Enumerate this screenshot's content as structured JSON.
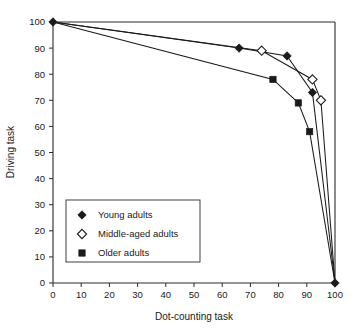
{
  "chart_data": {
    "type": "line",
    "title": "",
    "xlabel": "Dot-counting task",
    "ylabel": "Driving task",
    "xlim": [
      0,
      100
    ],
    "ylim": [
      0,
      100
    ],
    "xticks": [
      0,
      10,
      20,
      30,
      40,
      50,
      60,
      70,
      80,
      90,
      100
    ],
    "yticks": [
      0,
      10,
      20,
      30,
      40,
      50,
      60,
      70,
      80,
      90,
      100
    ],
    "grid": false,
    "legend_position": "lower-left-inside",
    "series": [
      {
        "name": "Young adults",
        "marker": "filled-diamond",
        "color": "#1a1a1a",
        "points": [
          {
            "x": 0,
            "y": 100
          },
          {
            "x": 66,
            "y": 90
          },
          {
            "x": 83,
            "y": 87
          },
          {
            "x": 92,
            "y": 73
          },
          {
            "x": 100,
            "y": 0
          }
        ]
      },
      {
        "name": "Middle-aged adults",
        "marker": "open-diamond",
        "color": "#1a1a1a",
        "points": [
          {
            "x": 0,
            "y": 100
          },
          {
            "x": 74,
            "y": 89
          },
          {
            "x": 92,
            "y": 78
          },
          {
            "x": 95,
            "y": 70
          },
          {
            "x": 100,
            "y": 0
          }
        ]
      },
      {
        "name": "Older adults",
        "marker": "filled-square",
        "color": "#1a1a1a",
        "points": [
          {
            "x": 0,
            "y": 100
          },
          {
            "x": 78,
            "y": 78
          },
          {
            "x": 87,
            "y": 69
          },
          {
            "x": 91,
            "y": 58
          },
          {
            "x": 100,
            "y": 0
          }
        ]
      }
    ]
  },
  "axis": {
    "x_title": "Dot-counting task",
    "y_title": "Driving task",
    "x_tick_labels": [
      "0",
      "10",
      "20",
      "30",
      "40",
      "50",
      "60",
      "70",
      "80",
      "90",
      "100"
    ],
    "y_tick_labels": [
      "0",
      "10",
      "20",
      "30",
      "40",
      "50",
      "60",
      "70",
      "80",
      "90",
      "100"
    ]
  },
  "legend": {
    "items": [
      {
        "label": "Young adults",
        "marker": "filled-diamond"
      },
      {
        "label": "Middle-aged adults",
        "marker": "open-diamond"
      },
      {
        "label": "Older adults",
        "marker": "filled-square"
      }
    ]
  }
}
